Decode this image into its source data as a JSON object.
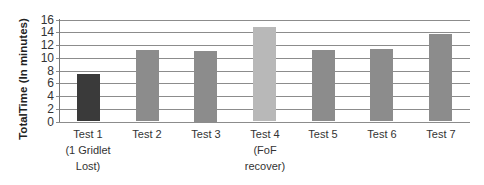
{
  "chart_data": {
    "type": "bar",
    "title": "",
    "xlabel": "",
    "ylabel": "TotalTime (In minutes)",
    "ylim": [
      0,
      16
    ],
    "yticks": [
      0,
      2,
      4,
      6,
      8,
      10,
      12,
      14,
      16
    ],
    "grid": true,
    "legend": null,
    "categories": [
      "Test 1 (1 Gridlet Lost)",
      "Test 2",
      "Test 3",
      "Test 4 (FoF recover)",
      "Test 5",
      "Test 6",
      "Test 7"
    ],
    "category_lines": [
      [
        "Test 1",
        "(1 Gridlet",
        "Lost)"
      ],
      [
        "Test 2"
      ],
      [
        "Test 3"
      ],
      [
        "Test 4",
        "(FoF",
        "recover)"
      ],
      [
        "Test 5"
      ],
      [
        "Test 6"
      ],
      [
        "Test 7"
      ]
    ],
    "values": [
      7.4,
      11.2,
      11.1,
      14.8,
      11.2,
      11.3,
      13.7
    ],
    "colors": [
      "#3a3a3a",
      "#8c8c8c",
      "#8c8c8c",
      "#b8b8b8",
      "#8c8c8c",
      "#8c8c8c",
      "#8c8c8c"
    ]
  }
}
